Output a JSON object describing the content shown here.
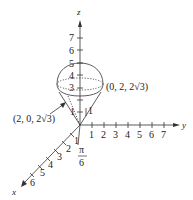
{
  "figure": {
    "axes": {
      "z": {
        "label": "z",
        "ticks": [
          "1",
          "3",
          "4",
          "5",
          "6",
          "7"
        ]
      },
      "y": {
        "label": "y",
        "ticks": [
          "1",
          "2",
          "3",
          "4",
          "5",
          "6",
          "7"
        ]
      },
      "x": {
        "label": "x",
        "ticks": [
          "1",
          "2",
          "3",
          "4",
          "5",
          "6"
        ]
      }
    },
    "annotations": {
      "point_right": "(0, 2, 2√3)",
      "point_left": "(2, 0, 2√3)",
      "angle_num": "π",
      "angle_den": "6",
      "cone_height_label": "1"
    },
    "colors": {
      "ink": "#222222",
      "background": "#ffffff"
    }
  }
}
